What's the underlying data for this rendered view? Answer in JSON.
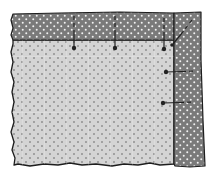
{
  "diagram": {
    "colors": {
      "background": "#ffffff",
      "fabric": "#d4d4d4",
      "fabric_dot": "#8c8c8c",
      "fabric_grid": "#ebebeb",
      "binding": "#7a7a7a",
      "binding_dot": "#f2f2f2",
      "outline": "#1e1e1e",
      "pin": "#222222"
    },
    "parts": {
      "fabric": {
        "label": "Fabric (light dotted)"
      },
      "top_binding": {
        "label": "Top binding strip (dark dotted)"
      },
      "right_binding": {
        "label": "Right binding strip (dark dotted)"
      }
    },
    "pins": [
      {
        "id": "top-pin-1",
        "orientation": "vertical",
        "head": [
          74,
          48
        ],
        "tail": [
          74,
          16
        ]
      },
      {
        "id": "top-pin-2",
        "orientation": "vertical",
        "head": [
          115,
          48
        ],
        "tail": [
          115,
          16
        ]
      },
      {
        "id": "top-pin-3",
        "orientation": "vertical",
        "head": [
          164,
          49
        ],
        "tail": [
          164,
          18
        ]
      },
      {
        "id": "corner-pin",
        "orientation": "diagonal",
        "head": [
          172,
          45
        ],
        "tail": [
          192,
          20
        ]
      },
      {
        "id": "right-pin-1",
        "orientation": "horizontal",
        "head": [
          166,
          72
        ],
        "tail": [
          196,
          71
        ]
      },
      {
        "id": "right-pin-2",
        "orientation": "horizontal",
        "head": [
          163,
          103
        ],
        "tail": [
          194,
          102
        ]
      }
    ]
  }
}
